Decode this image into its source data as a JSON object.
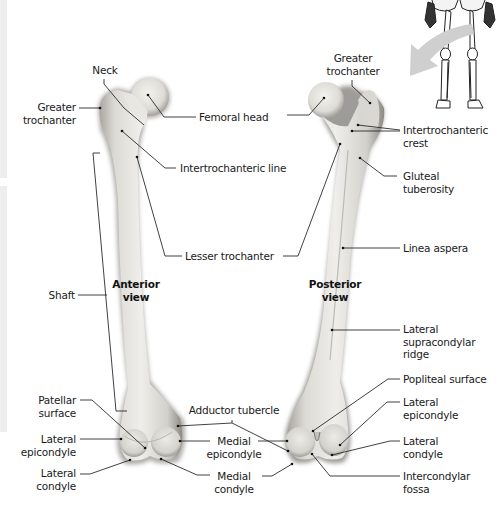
{
  "figure": {
    "colors": {
      "background": "#ffffff",
      "bone": "#e6e4df",
      "bone_shadow": "#8f8c86",
      "leader": "#2b2b2b",
      "arrow": "#c8c8c8",
      "text": "#1a1a1a"
    }
  },
  "views": {
    "anterior": {
      "line1": "Anterior",
      "line2": "view"
    },
    "posterior": {
      "line1": "Posterior",
      "line2": "view"
    }
  },
  "labels": {
    "neck": {
      "line1": "Neck"
    },
    "greater_trochanter_left": {
      "line1": "Greater",
      "line2": "trochanter"
    },
    "femoral_head": {
      "line1": "Femoral head"
    },
    "intertrochanteric_line": {
      "line1": "Intertrochanteric line"
    },
    "lesser_trochanter": {
      "line1": "Lesser trochanter"
    },
    "shaft": {
      "line1": "Shaft"
    },
    "patellar_surface": {
      "line1": "Patellar",
      "line2": "surface"
    },
    "lateral_epicondyle_left": {
      "line1": "Lateral",
      "line2": "epicondyle"
    },
    "lateral_condyle_left": {
      "line1": "Lateral",
      "line2": "condyle"
    },
    "adductor_tubercle": {
      "line1": "Adductor tubercle"
    },
    "medial_epicondyle": {
      "line1": "Medial",
      "line2": "epicondyle"
    },
    "medial_condyle": {
      "line1": "Medial",
      "line2": "condyle"
    },
    "greater_trochanter_right": {
      "line1": "Greater",
      "line2": "trochanter"
    },
    "intertrochanteric_crest": {
      "line1": "Intertrochanteric",
      "line2": "crest"
    },
    "gluteal_tuberosity": {
      "line1": "Gluteal",
      "line2": "tuberosity"
    },
    "linea_aspera": {
      "line1": "Linea aspera"
    },
    "lateral_supracondylar_ridge": {
      "line1": "Lateral",
      "line2": "supracondylar",
      "line3": "ridge"
    },
    "popliteal_surface": {
      "line1": "Popliteal surface"
    },
    "lateral_epicondyle_right": {
      "line1": "Lateral",
      "line2": "epicondyle"
    },
    "lateral_condyle_right": {
      "line1": "Lateral",
      "line2": "condyle"
    },
    "intercondylar_fossa": {
      "line1": "Intercondylar",
      "line2": "fossa"
    }
  },
  "inset": {
    "icon": "skeleton-legs-icon",
    "arrow": "curved-arrow-icon"
  }
}
